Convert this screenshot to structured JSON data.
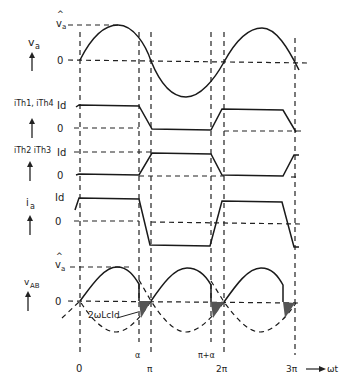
{
  "diagram": {
    "title": "",
    "rows": [
      {
        "id": "va",
        "signal_label": "v",
        "signal_sub": "a",
        "levels": [
          {
            "label": "v̂a",
            "value": "peak"
          },
          {
            "label": "0",
            "value": "zero"
          }
        ]
      },
      {
        "id": "ith14",
        "signal_label": "iTh1, iTh4",
        "levels": [
          {
            "label": "Id"
          },
          {
            "label": "0"
          }
        ]
      },
      {
        "id": "ith23",
        "signal_label": "iTh2 iTh3",
        "levels": [
          {
            "label": "Id"
          },
          {
            "label": "0"
          }
        ]
      },
      {
        "id": "ia",
        "signal_label": "i",
        "signal_sub": "a",
        "levels": [
          {
            "label": "Id"
          },
          {
            "label": "0"
          }
        ]
      },
      {
        "id": "vab",
        "signal_label": "v",
        "signal_sub": "AB",
        "levels": [
          {
            "label": "v̂a"
          },
          {
            "label": "0"
          }
        ]
      }
    ],
    "labels": {
      "va_peak_hat": "^",
      "va_peak": "v",
      "va_peak_sub": "a",
      "va_zero": "0",
      "va_sig": "v",
      "va_sig_sub": "a",
      "ith14_sig": "iTh1, iTh4",
      "ith14_id": "Id",
      "ith14_zero": "0",
      "ith23_sig": "iTh2 iTh3",
      "ith23_id": "Id",
      "ith23_zero": "0",
      "ia_sig": "i",
      "ia_sig_sub": "a",
      "ia_id": "Id",
      "ia_zero": "0",
      "vab_sig": "v",
      "vab_sig_sub": "AB",
      "vab_peak_hat": "^",
      "vab_peak": "v",
      "vab_peak_sub": "a",
      "vab_zero": "0",
      "annotation": "2ωLcId"
    },
    "x_axis": {
      "ticks": [
        {
          "label": "0",
          "x": 80
        },
        {
          "label": "α",
          "x": 139
        },
        {
          "label": "π",
          "x": 151
        },
        {
          "label": "π+α",
          "x": 211
        },
        {
          "label": "2π",
          "x": 224
        },
        {
          "label": "3π",
          "x": 295
        }
      ],
      "axis_label": "ωt",
      "arrow": "→"
    }
  }
}
